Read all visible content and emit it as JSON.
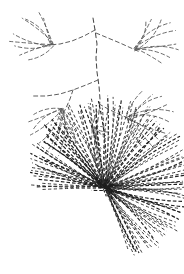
{
  "artwork": {
    "title": "Dashed-stroke botanical sketch",
    "description": "Line drawing of a branching plant with feathery leaf clusters above and a dense radial seed-head burst below",
    "width": 184,
    "height": 274,
    "background_color": "#ffffff",
    "ink_color": "#4a4a4a",
    "ink_color_dark": "#1e1e1e",
    "style": "dashed-stroke pen-and-ink"
  },
  "chart_data": {
    "type": "scatter",
    "xlabel": "",
    "ylabel": "",
    "xlim": [
      0,
      184
    ],
    "ylim": [
      0,
      274
    ],
    "grid": false,
    "legend": "none",
    "annotations": [
      "branching stem descends from top-center",
      "four feathery leaf clusters on lateral twigs",
      "radial burst of fine rays at lower center"
    ],
    "stem": {
      "label": "main-stem",
      "path": "M 93 18 L 95 30 L 97 44 L 96 58 L 97 72 L 99 86 L 100 99 L 99 112 L 97 126 L 95 140 L 94 152 L 96 164 L 100 176 L 105 188"
    },
    "twigs": [
      {
        "label": "twig-upper-left",
        "path": "M 95 30 L 84 36 L 72 41 L 60 44 L 49 45"
      },
      {
        "label": "twig-upper-right",
        "path": "M 96 33 L 108 38 L 120 43 L 131 48 L 140 52"
      },
      {
        "label": "twig-mid-left",
        "path": "M 98 80 L 86 85 L 73 90 L 60 94 L 46 96 L 33 96"
      },
      {
        "label": "twig-mid-left-lower",
        "path": "M 73 90 L 70 99 L 66 108 L 62 116"
      },
      {
        "label": "twig-mid-right",
        "path": "M 99 104 L 110 110 L 121 115 L 132 120"
      },
      {
        "label": "twig-center-short",
        "path": "M 97 112 L 94 120 L 92 128"
      }
    ],
    "leaf_clusters": [
      {
        "label": "cluster-upper-left",
        "origin_x": 52,
        "origin_y": 44,
        "leaf_count": 9,
        "spread_deg": [
          150,
          255
        ],
        "length_range": [
          18,
          40
        ]
      },
      {
        "label": "cluster-upper-right",
        "origin_x": 136,
        "origin_y": 50,
        "leaf_count": 9,
        "spread_deg": [
          285,
          30
        ],
        "length_range": [
          18,
          42
        ]
      },
      {
        "label": "cluster-lower-left",
        "origin_x": 62,
        "origin_y": 110,
        "leaf_count": 11,
        "spread_deg": [
          60,
          170
        ],
        "length_range": [
          18,
          44
        ]
      },
      {
        "label": "cluster-mid-right",
        "origin_x": 128,
        "origin_y": 118,
        "leaf_count": 10,
        "spread_deg": [
          300,
          65
        ],
        "length_range": [
          18,
          46
        ]
      },
      {
        "label": "cluster-center-small",
        "origin_x": 94,
        "origin_y": 128,
        "leaf_count": 7,
        "spread_deg": [
          0,
          100
        ],
        "length_range": [
          9,
          20
        ]
      }
    ],
    "burst": {
      "label": "radial-seed-head",
      "center_x": 105,
      "center_y": 188,
      "ray_count": 120,
      "angle_start_deg": 178,
      "angle_end_deg": 430,
      "radius_min": 46,
      "radius_max": 88,
      "dash_pattern": "3.2 2.4"
    }
  }
}
